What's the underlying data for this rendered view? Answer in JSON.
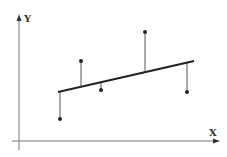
{
  "diagram": {
    "title": "",
    "axes": {
      "x_label": "X",
      "y_label": "Y",
      "axis_color": "#777777"
    },
    "regression_line": {
      "from": [
        58,
        92
      ],
      "to": [
        194,
        61
      ],
      "color": "#222222"
    },
    "points": [
      {
        "x": 60,
        "y": 119,
        "fit_y": 92
      },
      {
        "x": 81,
        "y": 61,
        "fit_y": 87
      },
      {
        "x": 101,
        "y": 90,
        "fit_y": 83
      },
      {
        "x": 145,
        "y": 32,
        "fit_y": 73
      },
      {
        "x": 187,
        "y": 92,
        "fit_y": 63
      }
    ],
    "point_color": "#222222",
    "residual_color": "#555555"
  }
}
